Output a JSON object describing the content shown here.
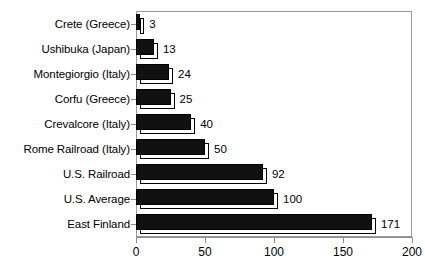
{
  "chart_data": {
    "type": "bar",
    "orientation": "horizontal",
    "title": "",
    "subtitle": "",
    "xlabel": "",
    "ylabel": "",
    "xlim": [
      0,
      200
    ],
    "xticks": [
      0,
      50,
      100,
      150,
      200
    ],
    "xtick_labels": [
      "0",
      "50",
      "100",
      "150",
      "200"
    ],
    "grid": false,
    "legend": false,
    "legend_position": "none",
    "categories": [
      "Crete (Greece)",
      "Ushibuka (Japan)",
      "Montegiorgio (Italy)",
      "Corfu (Greece)",
      "Crevalcore (Italy)",
      "Rome Railroad (Italy)",
      "U.S. Railroad",
      "U.S. Average",
      "East Finland"
    ],
    "values": [
      3,
      13,
      24,
      25,
      40,
      50,
      92,
      100,
      171
    ],
    "value_labels": [
      "3",
      "13",
      "24",
      "25",
      "40",
      "50",
      "92",
      "100",
      "171"
    ],
    "colors": {
      "bar_fill": "#111111",
      "bar_outline": "#000000",
      "bar_shadow_fill": "#ffffff",
      "axis": "#8d8d8d",
      "frame": "#9a9a9a",
      "text": "#000000",
      "background": "#ffffff"
    }
  }
}
